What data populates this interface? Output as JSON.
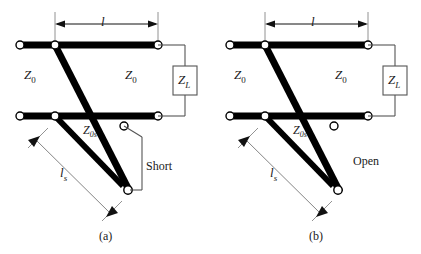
{
  "figure": {
    "panels": [
      {
        "id": "a",
        "caption": "(a)",
        "termination": "Short",
        "line_impedance_left": "Z",
        "line_impedance_left_sub": "0",
        "line_impedance_right": "Z",
        "line_impedance_right_sub": "0",
        "stub_impedance": "Z",
        "stub_impedance_sub": "0s",
        "load_label": "Z",
        "load_label_sub": "L",
        "length_label": "l",
        "stub_length_label": "l",
        "stub_length_sub": "s"
      },
      {
        "id": "b",
        "caption": "(b)",
        "termination": "Open",
        "line_impedance_left": "Z",
        "line_impedance_left_sub": "0",
        "line_impedance_right": "Z",
        "line_impedance_right_sub": "0",
        "stub_impedance": "Z",
        "stub_impedance_sub": "0s",
        "load_label": "Z",
        "load_label_sub": "L",
        "length_label": "l",
        "stub_length_label": "l",
        "stub_length_sub": "s"
      }
    ],
    "colors": {
      "conductor": "#000000",
      "thin_line": "#555555",
      "text": "#1a1a1a",
      "background": "#ffffff",
      "terminal_fill": "#ffffff"
    }
  }
}
